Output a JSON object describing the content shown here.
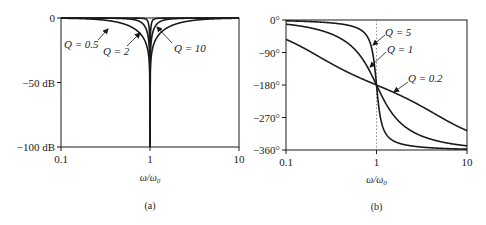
{
  "chart_data": [
    {
      "type": "line",
      "title": "",
      "caption": "(a)",
      "xlabel": "ω/ω₀",
      "ylabel": "",
      "xscale": "log",
      "xlim": [
        0.1,
        10
      ],
      "ylim": [
        -100,
        0
      ],
      "xticks": [
        0.1,
        1,
        10
      ],
      "xtick_labels": [
        "0.1",
        "1",
        "10"
      ],
      "yticks": [
        0,
        -50,
        -100
      ],
      "ytick_labels": [
        "0",
        "−50 dB",
        "−100 dB"
      ],
      "grid": false,
      "legend": "none (inline annotations)",
      "series": [
        {
          "name": "Q = 0.5",
          "q": 0.5,
          "x": [
            0.1,
            0.2,
            0.5,
            0.8,
            0.95,
            1.0,
            1.05,
            1.25,
            2,
            5,
            10
          ],
          "values": [
            -0.2,
            -0.7,
            -4.4,
            -12.3,
            -26.0,
            -100,
            -26.0,
            -12.3,
            -4.4,
            -0.7,
            -0.2
          ]
        },
        {
          "name": "Q = 2",
          "q": 2,
          "x": [
            0.1,
            0.2,
            0.5,
            0.8,
            0.95,
            1.0,
            1.05,
            1.25,
            2,
            5,
            10
          ],
          "values": [
            0.0,
            -0.05,
            -0.3,
            -1.8,
            -14.2,
            -100,
            -14.2,
            -1.8,
            -0.3,
            -0.05,
            0.0
          ]
        },
        {
          "name": "Q = 10",
          "q": 10,
          "x": [
            0.1,
            0.2,
            0.5,
            0.8,
            0.95,
            1.0,
            1.05,
            1.25,
            2,
            5,
            10
          ],
          "values": [
            0.0,
            0.0,
            0.0,
            -0.1,
            -2.0,
            -100,
            -2.0,
            -0.1,
            0.0,
            0.0,
            0.0
          ]
        }
      ],
      "annotations": [
        {
          "text": "Q = 0.5",
          "target": "Q = 0.5"
        },
        {
          "text": "Q = 2",
          "target": "Q = 2"
        },
        {
          "text": "Q = 10",
          "target": "Q = 10"
        }
      ]
    },
    {
      "type": "line",
      "title": "",
      "caption": "(b)",
      "xlabel": "ω/ω₀",
      "ylabel": "",
      "xscale": "log",
      "xlim": [
        0.1,
        10
      ],
      "ylim": [
        -360,
        0
      ],
      "xticks": [
        0.1,
        1,
        10
      ],
      "xtick_labels": [
        "0.1",
        "1",
        "10"
      ],
      "yticks": [
        0,
        -90,
        -180,
        -270,
        -360
      ],
      "ytick_labels": [
        "0°",
        "−90°",
        "−180°",
        "−270°",
        "−360°"
      ],
      "grid": false,
      "vline": {
        "x": 1,
        "style": "dotted"
      },
      "legend": "none (inline annotations)",
      "series": [
        {
          "name": "Q = 5",
          "q": 5,
          "x": [
            0.1,
            0.2,
            0.5,
            0.8,
            0.9,
            1.0,
            1.1,
            1.25,
            2,
            5,
            10
          ],
          "values": [
            -2.3,
            -4.8,
            -15.2,
            -48.0,
            -87.0,
            -180,
            -273.0,
            -312.0,
            -344.8,
            -355.2,
            -357.7
          ]
        },
        {
          "name": "Q = 1",
          "q": 1,
          "x": [
            0.1,
            0.2,
            0.5,
            0.8,
            0.9,
            1.0,
            1.1,
            1.25,
            2,
            5,
            10
          ],
          "values": [
            -11.5,
            -23.5,
            -67.4,
            -131.5,
            -155.8,
            -180,
            -204.2,
            -228.5,
            -292.6,
            -336.5,
            -348.5
          ]
        },
        {
          "name": "Q = 0.2",
          "q": 0.2,
          "x": [
            0.1,
            0.2,
            0.5,
            0.8,
            0.9,
            1.0,
            1.1,
            1.25,
            2,
            5,
            10
          ],
          "values": [
            -54.0,
            -92.0,
            -135.5,
            -163.0,
            -171.5,
            -180,
            -188.5,
            -197.0,
            -224.5,
            -268.0,
            -306.0
          ]
        }
      ],
      "annotations": [
        {
          "text": "Q = 5",
          "target": "Q = 5"
        },
        {
          "text": "Q = 1",
          "target": "Q = 1"
        },
        {
          "text": "Q = 0.2",
          "target": "Q = 0.2"
        }
      ]
    }
  ],
  "labels": {
    "a": {
      "y0": "0",
      "y50": "−50 dB",
      "y100": "−100 dB",
      "x01": "0.1",
      "x1": "1",
      "x10": "10",
      "xlabel": "ω/ω",
      "xlabel_sub": "0",
      "caption": "(a)",
      "ann_q05": "Q = 0.5",
      "ann_q2": "Q = 2",
      "ann_q10": "Q = 10"
    },
    "b": {
      "y0": "0°",
      "y90": "−90°",
      "y180": "−180°",
      "y270": "−270°",
      "y360": "−360°",
      "x01": "0.1",
      "x1": "1",
      "x10": "10",
      "xlabel": "ω/ω",
      "xlabel_sub": "0",
      "caption": "(b)",
      "ann_q5": "Q = 5",
      "ann_q1": "Q = 1",
      "ann_q02": "Q = 0.2"
    }
  },
  "colors": {
    "ink": "#1a1a1a",
    "background": "#ffffff",
    "dotted": "#777777"
  }
}
